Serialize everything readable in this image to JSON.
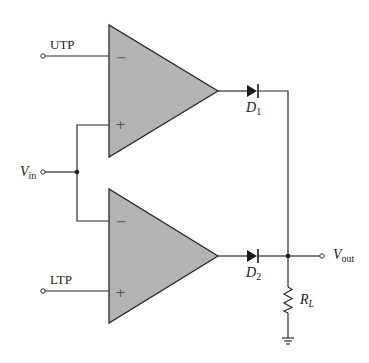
{
  "diagram": {
    "type": "circuit-schematic",
    "colors": {
      "background": "#ffffff",
      "opamp_fill": "#b4b4b4",
      "line": "#2a2a2a"
    },
    "components": {
      "opamp_top": {
        "name": "Upper comparator",
        "inverting_symbol": "−",
        "noninverting_symbol": "+"
      },
      "opamp_bottom": {
        "name": "Lower comparator",
        "inverting_symbol": "−",
        "noninverting_symbol": "+"
      },
      "diode_1": {
        "label_main": "D",
        "label_sub": "1"
      },
      "diode_2": {
        "label_main": "D",
        "label_sub": "2"
      },
      "resistor": {
        "label_main": "R",
        "label_sub": "L"
      },
      "ground": {
        "name": "ground"
      }
    },
    "terminals": {
      "utp": {
        "label": "UTP"
      },
      "ltp": {
        "label": "LTP"
      },
      "vin": {
        "label_main": "V",
        "label_sub": "in"
      },
      "vout": {
        "label_main": "V",
        "label_sub": "out"
      }
    },
    "connections": [
      "UTP → inverting input of upper comparator",
      "Vin → non-inverting input of upper comparator",
      "Vin → inverting input of lower comparator",
      "LTP → non-inverting input of lower comparator",
      "Upper comparator output → D1 → output node",
      "Lower comparator output → D2 → output node",
      "Output node → Vout",
      "Output node → RL → ground"
    ]
  }
}
